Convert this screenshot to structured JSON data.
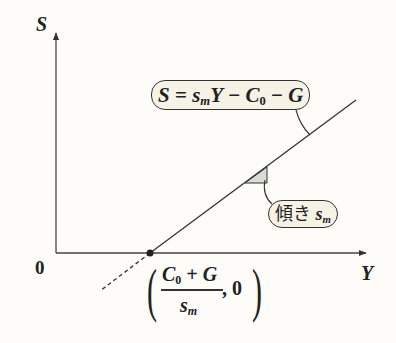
{
  "diagram": {
    "axes": {
      "y_label": "S",
      "x_label": "Y",
      "origin_label": "0"
    },
    "equation": {
      "lhs": "S",
      "eq": " = ",
      "s": "s",
      "s_sub": "m",
      "y": "Y",
      "minus1": " − ",
      "c": "C",
      "c_sub": "0",
      "minus2": " − ",
      "g": "G"
    },
    "slope_label": {
      "text": "傾き ",
      "s": "s",
      "s_sub": "m"
    },
    "intercept_point": {
      "numerator_c": "C",
      "numerator_c_sub": "0",
      "numerator_rest": " + G",
      "denominator_s": "s",
      "denominator_sub": "m",
      "second_coord": ", 0"
    },
    "colors": {
      "background": "#fdfcf8",
      "line": "#333333",
      "bubble_fill": "#f6f2e6",
      "slope_triangle": "#d8dcd4"
    }
  }
}
